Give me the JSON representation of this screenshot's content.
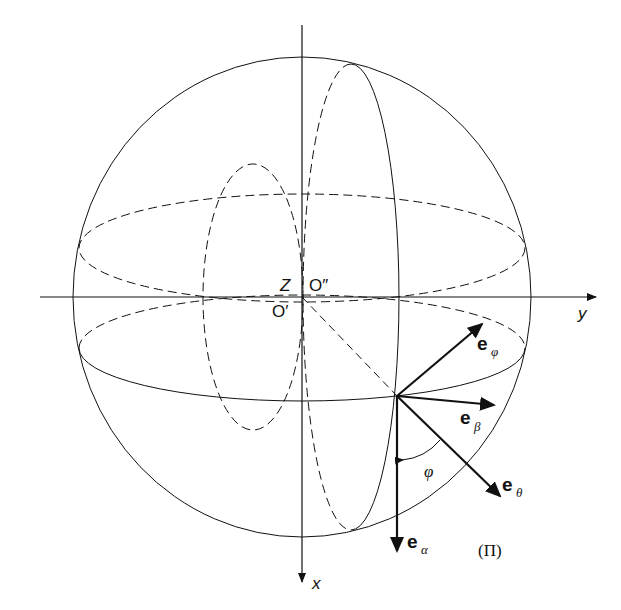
{
  "diagram": {
    "axes": {
      "y_label": "y",
      "x_label": "x"
    },
    "center_labels": {
      "z": "Z",
      "o_double_prime": "O″",
      "o_prime": "O′"
    },
    "vectors": [
      {
        "name": "e_phi",
        "base": "e",
        "sub": "φ"
      },
      {
        "name": "e_beta",
        "base": "e",
        "sub": "β"
      },
      {
        "name": "e_theta",
        "base": "e",
        "sub": "θ"
      },
      {
        "name": "e_alpha",
        "base": "e",
        "sub": "α"
      }
    ],
    "angle_label": "φ",
    "plane_label": "(Π)",
    "colors": {
      "stroke": "#111111",
      "background": "#ffffff"
    }
  }
}
